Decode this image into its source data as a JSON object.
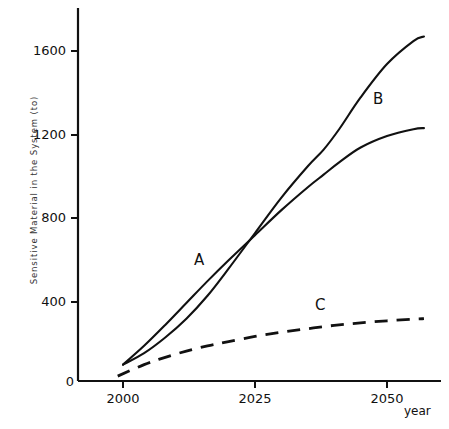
{
  "chart_data": {
    "type": "line",
    "title": "",
    "xlabel": "year",
    "ylabel": "Sensitive Material in the System (to)",
    "xlim": [
      1998,
      2057
    ],
    "ylim": [
      0,
      1800
    ],
    "xticks": [
      2000,
      2025,
      2050
    ],
    "xtick_labels": [
      "2000",
      "2025",
      "2050"
    ],
    "yticks": [
      0,
      400,
      800,
      1200,
      1600
    ],
    "ytick_labels": [
      "0",
      "400",
      "800",
      "1200",
      "1600"
    ],
    "grid": false,
    "legend_position": "inline-annotations",
    "origin_label": "0",
    "series": [
      {
        "name": "A",
        "label": "A",
        "style": "solid",
        "color": "#111111",
        "annotation_year": 2014,
        "annotation_value": 620,
        "x": [
          2000,
          2004,
          2008,
          2012,
          2016,
          2020,
          2025,
          2030,
          2035,
          2038,
          2041,
          2045,
          2050,
          2055,
          2057
        ],
        "y": [
          100,
          190,
          290,
          395,
          500,
          600,
          720,
          840,
          950,
          1010,
          1070,
          1140,
          1195,
          1228,
          1233
        ]
      },
      {
        "name": "B",
        "label": "B",
        "style": "solid",
        "color": "#111111",
        "annotation_year": 2050,
        "annotation_value": 1490,
        "x": [
          2000,
          2004,
          2008,
          2012,
          2016,
          2020,
          2025,
          2030,
          2035,
          2038,
          2041,
          2045,
          2050,
          2055,
          2057
        ],
        "y": [
          100,
          155,
          230,
          320,
          430,
          560,
          730,
          900,
          1050,
          1130,
          1230,
          1380,
          1540,
          1650,
          1672
        ]
      },
      {
        "name": "C",
        "label": "C",
        "style": "dashed",
        "color": "#111111",
        "annotation_year": 2037,
        "annotation_value": 420,
        "x": [
          1999,
          2004,
          2008,
          2012,
          2016,
          2020,
          2025,
          2030,
          2035,
          2040,
          2045,
          2050,
          2055,
          2057
        ],
        "y": [
          45,
          100,
          135,
          165,
          190,
          210,
          235,
          255,
          272,
          288,
          300,
          310,
          318,
          320
        ]
      }
    ],
    "intersection": {
      "series": [
        "A",
        "B"
      ],
      "year": 2038,
      "value": 1100
    }
  },
  "axis": {
    "origin_label": "0",
    "x_axis_label": "year"
  }
}
